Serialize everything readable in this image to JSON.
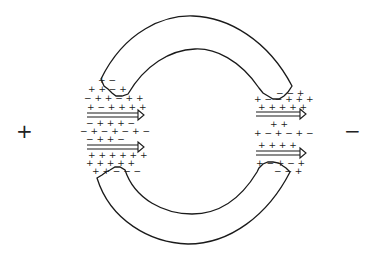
{
  "diagram": {
    "electrodes": {
      "left_label": "+",
      "right_label": "−"
    },
    "colors": {
      "stroke": "#1a1a1a",
      "background": "#ffffff"
    },
    "left_gap": {
      "charge_rows": [
        "+  −",
        "+ + − +",
        "− + + − + +",
        "+ − + + + +",
        "− + + + −",
        "− + − + − + −",
        "− + + −",
        "+ + + + + +",
        "+ + + + +",
        "+ + − − −"
      ],
      "arrows": 2
    },
    "right_gap": {
      "charge_rows": [
        "− − +",
        "+ − − + + +",
        "+ + + + +",
        "+ +",
        "+ − + − + −",
        "+ + + +",
        "+ − + − +",
        "− − +"
      ],
      "arrows": 2
    }
  }
}
